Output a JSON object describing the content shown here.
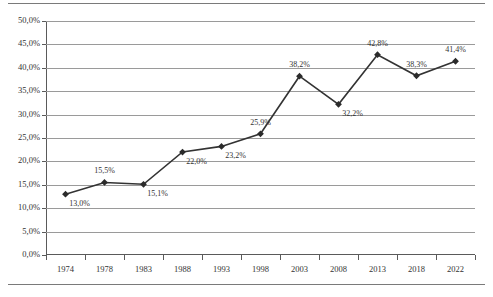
{
  "chart_data": {
    "type": "line",
    "title": "",
    "subtitle": "",
    "xlabel": "",
    "ylabel": "",
    "categories": [
      "1974",
      "1978",
      "1983",
      "1988",
      "1993",
      "1998",
      "2003",
      "2008",
      "2013",
      "2018",
      "2022"
    ],
    "values": [
      13.0,
      15.5,
      15.1,
      22.0,
      23.2,
      25.9,
      38.2,
      32.2,
      42.8,
      38.3,
      41.4
    ],
    "point_labels": [
      "13,0%",
      "15,5%",
      "15,1%",
      "22,0%",
      "23,2%",
      "25,9%",
      "38,2%",
      "32,2%",
      "42,8%",
      "38,3%",
      "41,4%"
    ],
    "label_positions": [
      "below",
      "above",
      "below",
      "below",
      "below",
      "above",
      "above",
      "below",
      "above",
      "above",
      "above"
    ],
    "ylim": [
      0,
      50
    ],
    "ytick_values": [
      0,
      5,
      10,
      15,
      20,
      25,
      30,
      35,
      40,
      45,
      50
    ],
    "ytick_labels": [
      "0,0%",
      "5,0%",
      "10,0%",
      "15,0%",
      "20,0%",
      "25,0%",
      "30,0%",
      "35,0%",
      "40,0%",
      "45,0%",
      "50,0%"
    ],
    "grid": "horizontal",
    "legend": "none",
    "series": [
      {
        "name": "",
        "marker": "diamond",
        "color": "#333333",
        "values": [
          13.0,
          15.5,
          15.1,
          22.0,
          23.2,
          25.9,
          38.2,
          32.2,
          42.8,
          38.3,
          41.4
        ]
      }
    ],
    "decimal_separator": ","
  },
  "style": {
    "line_color": "#333333",
    "marker_color": "#2b2b2b",
    "grid_color": "#9a9a9a",
    "axis_color": "#5a5a5a",
    "rule_color": "#7a7a7a",
    "text_color": "#333333",
    "background": "#ffffff"
  }
}
